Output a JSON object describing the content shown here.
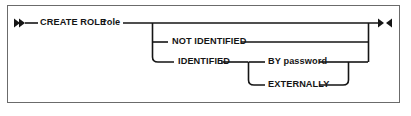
{
  "diagram": {
    "type": "railroad-syntax-diagram",
    "title": "CREATE ROLE",
    "line_color": "#151515",
    "border_color": "#6b6b6b",
    "background_color": "#ffffff",
    "start_marker": "double-right-arrow",
    "end_marker": "right-left-arrow",
    "nodes": {
      "create_role": "CREATE ROLE",
      "role_variable": "role",
      "not_identified": "NOT IDENTIFIED",
      "identified": "IDENTIFIED",
      "by_password": "BY password",
      "externally": "EXTERNALLY"
    },
    "paths": [
      {
        "name": "main-rail",
        "sequence": [
          "CREATE ROLE",
          "role"
        ]
      },
      {
        "name": "optional-branch-1",
        "sequence": [
          "NOT IDENTIFIED"
        ]
      },
      {
        "name": "optional-branch-2",
        "sequence": [
          "IDENTIFIED",
          "BY password"
        ]
      },
      {
        "name": "optional-branch-3",
        "sequence": [
          "IDENTIFIED",
          "EXTERNALLY"
        ]
      }
    ]
  }
}
